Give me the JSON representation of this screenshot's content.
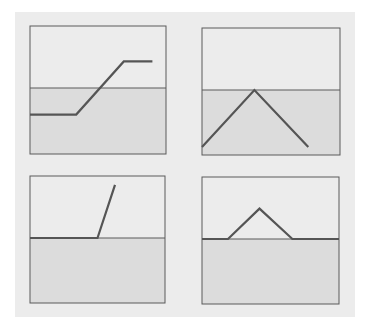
{
  "figure": {
    "colors": {
      "upper_fill": "#ececec",
      "lower_fill": "#dcdcdc",
      "frame": "#5a5a5a",
      "baseline": "#5a5a5a",
      "curve": "#555555"
    },
    "panels": [
      {
        "id": "top-left",
        "shape": "ramp-up-then-flat",
        "points": [
          [
            0,
            -0.7
          ],
          [
            0.34,
            -0.7
          ],
          [
            0.69,
            0.7
          ],
          [
            0.9,
            0.7
          ]
        ]
      },
      {
        "id": "top-right",
        "shape": "inverted-v-below-baseline",
        "points": [
          [
            0,
            -1.5
          ],
          [
            0.38,
            0
          ],
          [
            0.77,
            -1.5
          ]
        ]
      },
      {
        "id": "bottom-left",
        "shape": "flat-then-steep-rise",
        "points": [
          [
            0,
            0
          ],
          [
            0.5,
            0
          ],
          [
            0.63,
            1.4
          ]
        ]
      },
      {
        "id": "bottom-right",
        "shape": "triangular-bump",
        "points": [
          [
            0,
            0
          ],
          [
            0.19,
            0
          ],
          [
            0.42,
            0.8
          ],
          [
            0.66,
            0
          ],
          [
            1,
            0
          ]
        ]
      }
    ]
  }
}
